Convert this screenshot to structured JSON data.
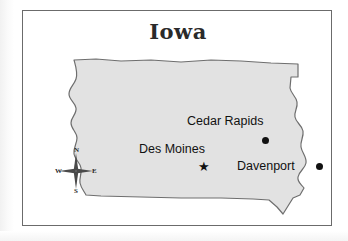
{
  "map": {
    "title": "Iowa",
    "state_name": "Iowa",
    "fill_color": "#e2e2e2",
    "outline_color": "#6e6e6e",
    "frame_color": "#6b6b6b",
    "background_color": "#ffffff",
    "marker_color": "#111111",
    "cities": [
      {
        "name": "Cedar Rapids",
        "marker": "dot",
        "label_position": "above-left",
        "marker_x": 243,
        "marker_y": 130
      },
      {
        "name": "Des Moines",
        "marker": "star",
        "label_position": "above",
        "is_capital": true,
        "marker_x": 180,
        "marker_y": 155
      },
      {
        "name": "Davenport",
        "marker": "dot",
        "label_position": "left",
        "marker_x": 297,
        "marker_y": 156
      }
    ],
    "compass_rose": {
      "north": "N",
      "east": "E",
      "south": "S",
      "west": "W"
    }
  }
}
